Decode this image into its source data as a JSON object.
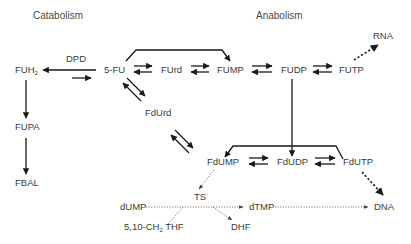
{
  "headers": {
    "catabolism": "Catabolism",
    "anabolism": "Anabolism"
  },
  "enzymes": {
    "dpd": "DPD",
    "ts": "TS"
  },
  "nodes": {
    "fuh2": "FUH",
    "fuh2_sub": "2",
    "fupa": "FUPA",
    "fbal": "FBAL",
    "fu5": "5-FU",
    "furd": "FUrd",
    "fump": "FUMP",
    "fudp": "FUDP",
    "futp": "FUTP",
    "rna": "RNA",
    "fdurd": "FdUrd",
    "fdump": "FdUMP",
    "fdudp": "FdUDP",
    "fdutp": "FdUTP",
    "dump": "dUMP",
    "dtmp": "dTMP",
    "dna": "DNA",
    "dhf": "DHF",
    "thf_a": "5,10-CH",
    "thf_sub": "2",
    "thf_b": " THF"
  },
  "colors": {
    "line": "#1a1a1a",
    "text": "#3a3a3a",
    "dotted": "#555555"
  }
}
